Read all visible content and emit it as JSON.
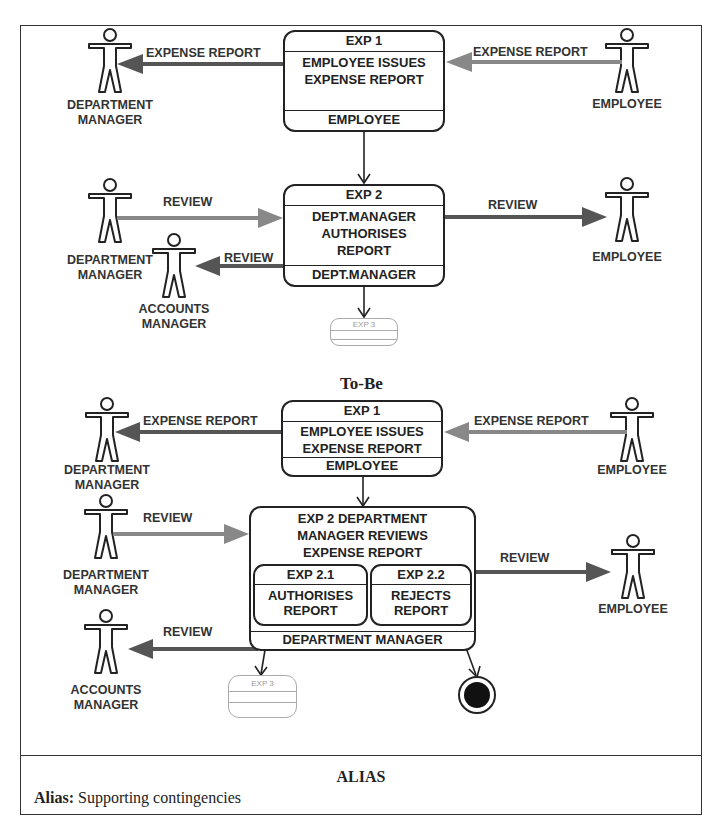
{
  "diagram": {
    "as_is": {
      "exp1": {
        "id": "EXP 1",
        "lines": [
          "EMPLOYEE ISSUES",
          "EXPENSE REPORT"
        ],
        "actor": "EMPLOYEE"
      },
      "exp2": {
        "id": "EXP 2",
        "lines": [
          "DEPT.MANAGER",
          "AUTHORISES",
          "REPORT"
        ],
        "actor": "DEPT.MANAGER"
      },
      "exp3": {
        "id": "EXP 3"
      },
      "actors": {
        "dept_manager_1": [
          "DEPARTMENT",
          "MANAGER"
        ],
        "employee_1": "EMPLOYEE",
        "dept_manager_2": [
          "DEPARTMENT",
          "MANAGER"
        ],
        "accounts_manager": [
          "ACCOUNTS",
          "MANAGER"
        ],
        "employee_2": "EMPLOYEE"
      },
      "flows": {
        "to_dept_manager": "EXPENSE REPORT",
        "from_employee": "EXPENSE REPORT",
        "from_dept_manager": "REVIEW",
        "to_employee": "REVIEW",
        "to_accounts_manager": "REVIEW"
      }
    },
    "to_be_title": "To-Be",
    "to_be": {
      "exp1": {
        "id": "EXP 1",
        "lines": [
          "EMPLOYEE ISSUES",
          "EXPENSE REPORT"
        ],
        "actor": "EMPLOYEE"
      },
      "exp2": {
        "title_lines": [
          "EXP 2 DEPARTMENT",
          "MANAGER REVIEWS",
          "EXPENSE REPORT"
        ],
        "sub1": {
          "id": "EXP 2.1",
          "lines": [
            "AUTHORISES",
            "REPORT"
          ]
        },
        "sub2": {
          "id": "EXP 2.2",
          "lines": [
            "REJECTS",
            "REPORT"
          ]
        },
        "actor": "DEPARTMENT MANAGER"
      },
      "exp3": {
        "id": "EXP 3"
      },
      "actors": {
        "dept_manager_1": [
          "DEPARTMENT",
          "MANAGER"
        ],
        "employee_1": "EMPLOYEE",
        "dept_manager_2": [
          "DEPARTMENT",
          "MANAGER"
        ],
        "employee_2": "EMPLOYEE",
        "accounts_manager": [
          "ACCOUNTS",
          "MANAGER"
        ]
      },
      "flows": {
        "to_dept_manager": "EXPENSE REPORT",
        "from_employee": "EXPENSE REPORT",
        "from_dept_manager": "REVIEW",
        "to_employee": "REVIEW",
        "to_accounts_manager": "REVIEW"
      }
    }
  },
  "alias": {
    "title": "ALIAS",
    "label": "Alias:",
    "value": "Supporting contingencies"
  },
  "colors": {
    "line": "#222222",
    "arrow_gray": "#6f6f6f",
    "arrow_light": "#8a8a8a",
    "faded": "#aaaaaa"
  }
}
